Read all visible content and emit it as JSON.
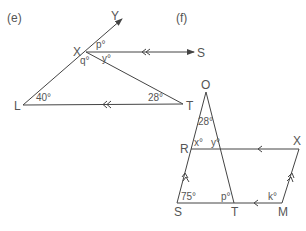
{
  "figures": [
    {
      "id": "e",
      "label": "(e)",
      "points": {
        "Y": "Y",
        "X": "X",
        "S": "S",
        "L": "L",
        "T": "T"
      },
      "angles": {
        "p": "p°",
        "q": "q°",
        "y": "y°",
        "L": "40°",
        "T": "28°"
      },
      "parallel_marker": "double-arrow"
    },
    {
      "id": "f",
      "label": "(f)",
      "points": {
        "O": "O",
        "R": "R",
        "X": "X",
        "S": "S",
        "T": "T",
        "M": "M"
      },
      "angles": {
        "O": "28°",
        "x": "x°",
        "y": "y°",
        "S": "75°",
        "p": "p°",
        "k": "k°"
      },
      "parallel_marker": "single-and-double-arrow"
    }
  ],
  "colors": {
    "line": "#444444",
    "text": "#555555"
  }
}
